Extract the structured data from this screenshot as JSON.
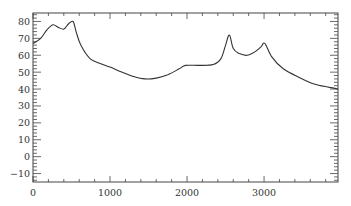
{
  "chart_data": {
    "type": "line",
    "title": "",
    "xlabel": "",
    "ylabel": "",
    "xlim": [
      0,
      3960
    ],
    "ylim": [
      -15,
      85
    ],
    "grid": false,
    "legend": null,
    "x_ticks": [
      0,
      1000,
      2000,
      3000
    ],
    "x_tick_labels": [
      "0",
      "1000",
      "2000",
      "3000"
    ],
    "y_ticks": [
      -10,
      0,
      10,
      20,
      30,
      40,
      50,
      60,
      70,
      80
    ],
    "y_tick_labels": [
      "−10",
      "0",
      "10",
      "20",
      "30",
      "40",
      "50",
      "60",
      "70",
      "80"
    ],
    "series": [
      {
        "name": "series-1",
        "color": "#333333",
        "x": [
          0,
          100,
          180,
          260,
          330,
          400,
          460,
          520,
          560,
          620,
          740,
          880,
          1000,
          1150,
          1300,
          1450,
          1600,
          1750,
          1900,
          1980,
          2150,
          2340,
          2440,
          2500,
          2550,
          2600,
          2680,
          2780,
          2880,
          2960,
          3010,
          3100,
          3250,
          3450,
          3650,
          3850,
          3960
        ],
        "values": [
          67,
          70,
          75,
          78,
          76.5,
          75.5,
          78.5,
          80,
          74,
          66,
          58,
          55,
          53,
          50,
          47.5,
          46,
          46.5,
          48.5,
          52,
          54,
          54,
          54.5,
          58,
          66,
          72,
          64,
          61,
          60,
          62,
          65,
          67,
          59,
          52,
          47,
          43,
          41,
          40
        ]
      }
    ]
  },
  "plot_area": {
    "left": 33,
    "right": 338,
    "top": 13,
    "bottom": 182
  }
}
